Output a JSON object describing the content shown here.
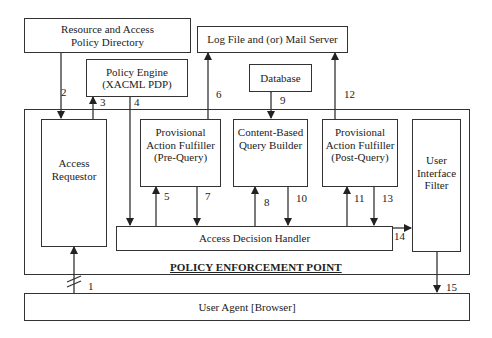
{
  "diagram": {
    "boxes": {
      "resource_directory": "Resource and Access Policy Directory",
      "log_mail_server": "Log File and (or) Mail Server",
      "policy_engine_line1": "Policy Engine",
      "policy_engine_line2": "(XACML PDP)",
      "database": "Database",
      "access_requestor": "Access Requestor",
      "pre_query": "Provisional Action Fulfiller (Pre-Query)",
      "content_query_builder": "Content-Based Query Builder",
      "post_query": "Provisional Action Fulfiller (Post-Query)",
      "ui_filter": "User Interface Filter",
      "access_decision_handler": "Access Decision Handler",
      "user_agent": "User Agent [Browser]"
    },
    "container_title": "POLICY ENFORCEMENT POINT",
    "edge_labels": [
      "1",
      "2",
      "3",
      "4",
      "5",
      "6",
      "7",
      "8",
      "9",
      "10",
      "11",
      "12",
      "13",
      "14",
      "15"
    ],
    "stroke_color": "#333333"
  }
}
